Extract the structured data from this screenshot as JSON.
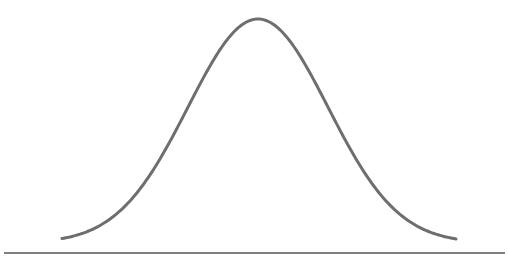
{
  "chart_data": {
    "type": "line",
    "title": "",
    "subtitle": "",
    "xlabel": "",
    "ylabel": "",
    "series": [
      {
        "name": "normal-curve",
        "shape": "gaussian",
        "center_x_px": 258,
        "sigma_px": 70,
        "baseline_y_px": 243,
        "peak_y_px": 19,
        "x_start_px": 62,
        "x_end_px": 456,
        "color": "#6e6e6e",
        "stroke_width": 3
      }
    ],
    "axis": {
      "y_px": 253,
      "x_start_px": 4,
      "x_end_px": 505,
      "color": "#555555",
      "stroke_width": 1.5
    },
    "grid": false,
    "legend": null,
    "tick_labels": []
  },
  "colors": {
    "background": "#ffffff",
    "curve": "#6e6e6e",
    "axis": "#555555"
  }
}
